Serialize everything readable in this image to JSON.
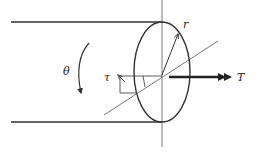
{
  "diagram": {
    "title": "",
    "labels": {
      "theta": "θ",
      "tau": "τ",
      "r": "r",
      "T": "T"
    },
    "colors": {
      "stroke": "#333333",
      "background": "#ffffff"
    }
  }
}
